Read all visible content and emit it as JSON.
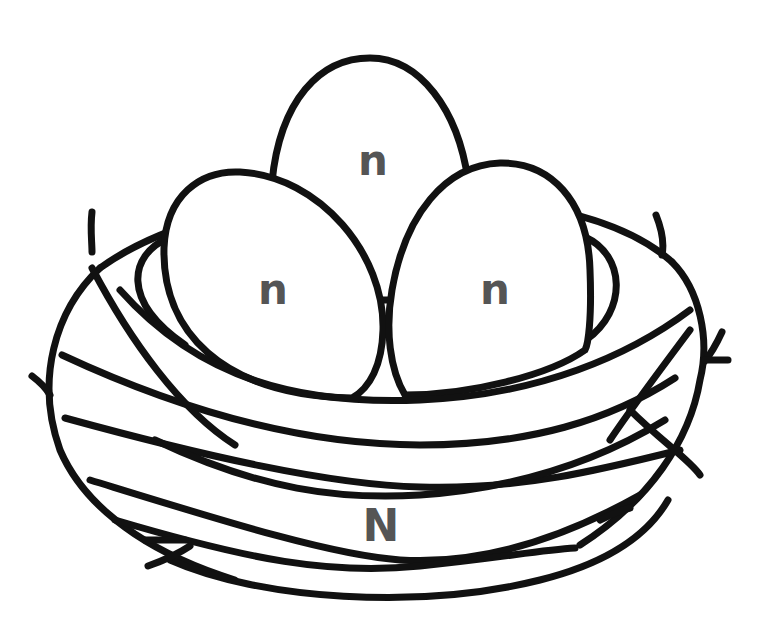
{
  "illustration": {
    "subject": "Bird nest with three eggs (coloring page)",
    "colors": {
      "outline": "#111111",
      "label": "#555555",
      "background": "#ffffff"
    },
    "eggs": [
      {
        "position": "top-center",
        "label": "n"
      },
      {
        "position": "left",
        "label": "n"
      },
      {
        "position": "right",
        "label": "n"
      }
    ],
    "nest": {
      "label": "N"
    }
  }
}
